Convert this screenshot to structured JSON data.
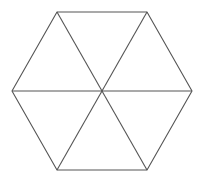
{
  "diagram": {
    "title": "",
    "shape": "regular hexagon divided into 6 equilateral triangles",
    "stroke_color": "#555555",
    "stroke_width": 1.1,
    "background": "#ffffff",
    "center": [
      102,
      91
    ],
    "vertices": [
      [
        57,
        12
      ],
      [
        147,
        12
      ],
      [
        192,
        91
      ],
      [
        147,
        170
      ],
      [
        57,
        170
      ],
      [
        12,
        91
      ]
    ]
  }
}
